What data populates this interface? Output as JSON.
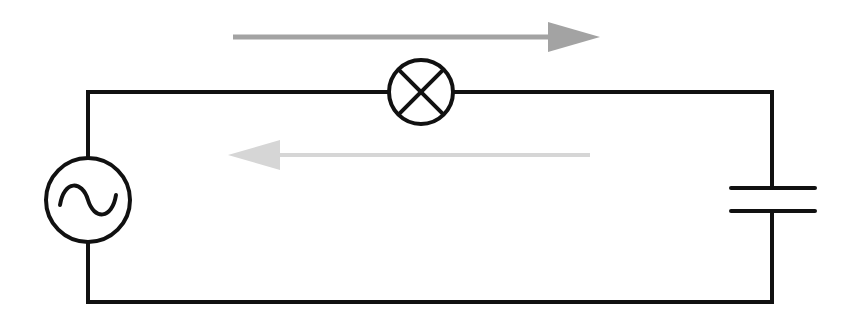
{
  "diagram": {
    "type": "circuit",
    "colors": {
      "wire": "#111111",
      "arrow_forward": "#a3a3a3",
      "arrow_backward": "#d6d6d6",
      "background": "#ffffff"
    },
    "components": [
      {
        "id": "ac-source",
        "kind": "AC voltage source",
        "symbol": "circle-with-sine"
      },
      {
        "id": "lamp",
        "kind": "lamp",
        "symbol": "circle-with-x"
      },
      {
        "id": "capacitor",
        "kind": "capacitor",
        "symbol": "parallel-plates"
      }
    ],
    "arrows": [
      {
        "id": "current-forward",
        "direction": "right"
      },
      {
        "id": "current-backward",
        "direction": "left"
      }
    ]
  }
}
